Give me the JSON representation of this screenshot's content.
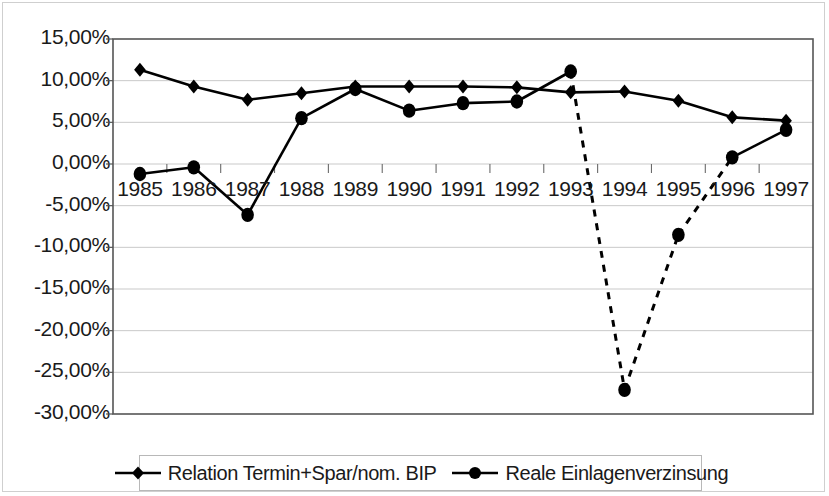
{
  "chart_data": {
    "type": "line",
    "title": "",
    "xlabel": "",
    "ylabel": "",
    "categories": [
      "1985",
      "1986",
      "1987",
      "1988",
      "1989",
      "1990",
      "1991",
      "1992",
      "1993",
      "1994",
      "1995",
      "1996",
      "1997"
    ],
    "ylim": [
      -30,
      15
    ],
    "ytick_values": [
      15,
      10,
      5,
      0,
      -5,
      -10,
      -15,
      -20,
      -25,
      -30
    ],
    "ytick_labels": [
      "15,00%",
      "10,00%",
      "5,00%",
      "0,00%",
      "-5,00%",
      "-10,00%",
      "-15,00%",
      "-20,00%",
      "-25,00%",
      "-30,00%"
    ],
    "grid": true,
    "legend_position": "bottom",
    "series": [
      {
        "name": "Relation Termin+Spar/nom. BIP",
        "marker": "diamond",
        "linestyle": "solid",
        "color": "#000000",
        "values": [
          11.3,
          9.3,
          7.7,
          8.5,
          9.3,
          9.3,
          9.3,
          9.2,
          8.6,
          8.7,
          7.6,
          5.6,
          5.2
        ]
      },
      {
        "name": "Reale Einlagenverzinsung",
        "marker": "circle",
        "linestyle": "solid",
        "dashed_segments": [
          [
            8,
            9
          ],
          [
            9,
            10
          ],
          [
            10,
            11
          ]
        ],
        "color": "#000000",
        "values": [
          -1.2,
          -0.4,
          -6.1,
          5.5,
          9.0,
          6.4,
          7.3,
          7.5,
          11.1,
          -27.1,
          -8.5,
          0.8,
          4.1
        ]
      }
    ]
  },
  "legend": {
    "items": [
      {
        "label": "Relation Termin+Spar/nom. BIP",
        "marker": "diamond-marker-icon"
      },
      {
        "label": "Reale Einlagenverzinsung",
        "marker": "circle-marker-icon"
      }
    ]
  }
}
